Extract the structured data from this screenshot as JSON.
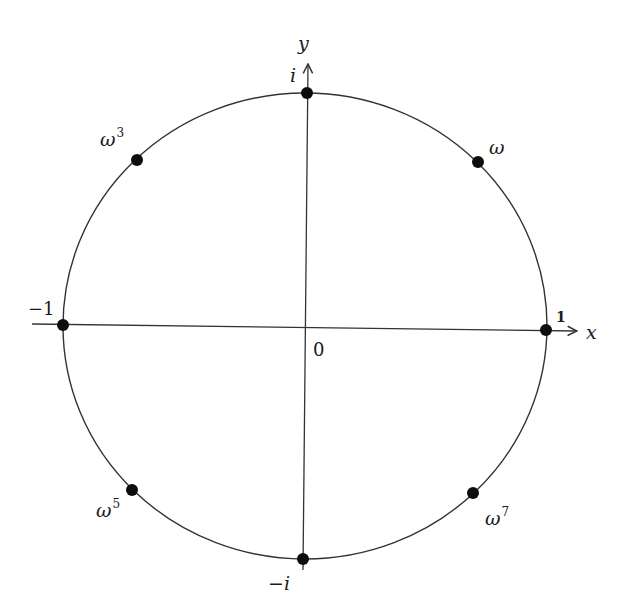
{
  "diagram": {
    "axes": {
      "x_label": "x",
      "y_label": "y",
      "origin_label": "0"
    },
    "colors": {
      "stroke": "#333333",
      "dot": "#0d0d0d",
      "background": "#ffffff"
    },
    "points": [
      {
        "id": "one",
        "label": "1",
        "base": "",
        "exp": "",
        "angle_deg": 0
      },
      {
        "id": "omega",
        "label": "ω",
        "base": "ω",
        "exp": "",
        "angle_deg": 45
      },
      {
        "id": "i",
        "label": "i",
        "base": "i",
        "exp": "",
        "angle_deg": 90
      },
      {
        "id": "omega3",
        "label": "ω³",
        "base": "ω",
        "exp": "3",
        "angle_deg": 135
      },
      {
        "id": "minus-one",
        "label": "−1",
        "base": "−1",
        "exp": "",
        "angle_deg": 180
      },
      {
        "id": "omega5",
        "label": "ω⁵",
        "base": "ω",
        "exp": "5",
        "angle_deg": 225
      },
      {
        "id": "minus-i",
        "label": "−i",
        "base": "−i",
        "exp": "",
        "angle_deg": 270
      },
      {
        "id": "omega7",
        "label": "ω⁷",
        "base": "ω",
        "exp": "7",
        "angle_deg": 315
      }
    ],
    "labels": {
      "one": "1",
      "omega": "ω",
      "i": "i",
      "omega3_base": "ω",
      "omega3_exp": "3",
      "minus_one": "−1",
      "omega5_base": "ω",
      "omega5_exp": "5",
      "minus_i": "−i",
      "omega7_base": "ω",
      "omega7_exp": "7"
    }
  }
}
